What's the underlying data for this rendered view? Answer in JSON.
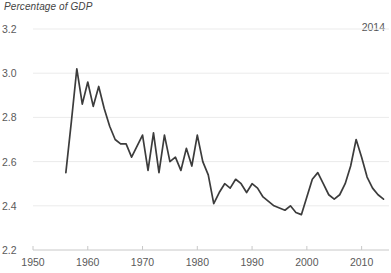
{
  "chart_data": {
    "type": "line",
    "title": "Percentage of GDP",
    "annotation": "2014",
    "xlabel": "",
    "ylabel": "",
    "grid": true,
    "legend": "none",
    "line_color": "#3c3c3c",
    "grid_color": "#ebebeb",
    "axis_color": "#c8c8c8",
    "text_color": "#5a5a5a",
    "xlim": [
      1950,
      2015
    ],
    "ylim": [
      2.2,
      3.2
    ],
    "yticks": [
      "3.2",
      "3.0",
      "2.8",
      "2.6",
      "2.4",
      "2.2"
    ],
    "ytick_values": [
      3.2,
      3.0,
      2.8,
      2.6,
      2.4,
      2.2
    ],
    "xticks": [
      "1950",
      "1960",
      "1970",
      "1980",
      "1990",
      "2000",
      "2010"
    ],
    "xtick_values": [
      1950,
      1960,
      1970,
      1980,
      1990,
      2000,
      2010
    ],
    "x": [
      1956,
      1957,
      1958,
      1959,
      1960,
      1961,
      1962,
      1963,
      1964,
      1965,
      1966,
      1967,
      1968,
      1969,
      1970,
      1971,
      1972,
      1973,
      1974,
      1975,
      1976,
      1977,
      1978,
      1979,
      1980,
      1981,
      1982,
      1983,
      1984,
      1985,
      1986,
      1987,
      1988,
      1989,
      1990,
      1991,
      1992,
      1993,
      1994,
      1995,
      1996,
      1997,
      1998,
      1999,
      2000,
      2001,
      2002,
      2003,
      2004,
      2005,
      2006,
      2007,
      2008,
      2009,
      2010,
      2011,
      2012,
      2013,
      2014
    ],
    "values": [
      2.55,
      2.78,
      3.02,
      2.86,
      2.96,
      2.85,
      2.94,
      2.84,
      2.76,
      2.7,
      2.68,
      2.68,
      2.62,
      2.67,
      2.72,
      2.56,
      2.73,
      2.55,
      2.72,
      2.6,
      2.62,
      2.56,
      2.66,
      2.58,
      2.72,
      2.6,
      2.54,
      2.41,
      2.46,
      2.5,
      2.48,
      2.52,
      2.5,
      2.46,
      2.5,
      2.48,
      2.44,
      2.42,
      2.4,
      2.39,
      2.38,
      2.4,
      2.37,
      2.36,
      2.44,
      2.52,
      2.55,
      2.5,
      2.45,
      2.43,
      2.45,
      2.5,
      2.58,
      2.7,
      2.62,
      2.53,
      2.48,
      2.45,
      2.43
    ]
  }
}
